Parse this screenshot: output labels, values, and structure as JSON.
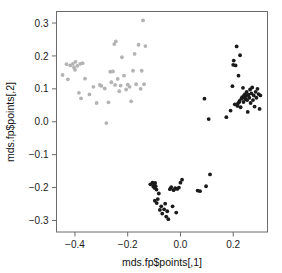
{
  "chart_data": {
    "type": "scatter",
    "title": "",
    "xlabel": "mds.fp$points[,1]",
    "ylabel": "mds.fp$points[,2]",
    "xlim": [
      -0.47,
      0.33
    ],
    "ylim": [
      -0.335,
      0.335
    ],
    "xticks": [
      -0.4,
      -0.2,
      0.0,
      0.2
    ],
    "xtick_labels": [
      "-0.4",
      "-0.2",
      "0.0",
      "0.2"
    ],
    "yticks": [
      -0.3,
      -0.2,
      -0.1,
      0.0,
      0.1,
      0.2,
      0.3
    ],
    "ytick_labels": [
      "-0.3",
      "-0.2",
      "-0.1",
      "0.0",
      "0.1",
      "0.2",
      "0.3"
    ],
    "grid": false,
    "legend": "none",
    "point_radius": 1.9,
    "series": [
      {
        "name": "cluster-light-left",
        "color": "#b3b3b3",
        "marker": "filled-circle",
        "points": [
          [
            -0.447,
            0.142
          ],
          [
            -0.432,
            0.175
          ],
          [
            -0.427,
            0.129
          ],
          [
            -0.418,
            0.171
          ],
          [
            -0.408,
            0.176
          ],
          [
            -0.404,
            0.165
          ],
          [
            -0.4,
            0.158
          ],
          [
            -0.398,
            0.182
          ],
          [
            -0.391,
            0.17
          ],
          [
            -0.385,
            0.088
          ],
          [
            -0.38,
            0.176
          ],
          [
            -0.377,
            0.071
          ],
          [
            -0.371,
            0.178
          ],
          [
            -0.362,
            0.131
          ],
          [
            -0.345,
            0.083
          ],
          [
            -0.33,
            0.106
          ],
          [
            -0.318,
            0.057
          ],
          [
            -0.306,
            0.112
          ],
          [
            -0.3,
            0.109
          ],
          [
            -0.287,
            0.101
          ],
          [
            -0.281,
            -0.004
          ],
          [
            -0.273,
            0.059
          ],
          [
            -0.266,
            0.152
          ],
          [
            -0.262,
            0.12
          ],
          [
            -0.256,
            0.153
          ],
          [
            -0.251,
            0.236
          ],
          [
            -0.248,
            0.112
          ],
          [
            -0.245,
            0.244
          ],
          [
            -0.238,
            0.13
          ],
          [
            -0.232,
            0.093
          ],
          [
            -0.227,
            0.11
          ],
          [
            -0.222,
            0.196
          ],
          [
            -0.214,
            0.14
          ],
          [
            -0.206,
            0.098
          ],
          [
            -0.2,
            0.113
          ],
          [
            -0.193,
            0.106
          ],
          [
            -0.187,
            0.062
          ],
          [
            -0.18,
            0.155
          ],
          [
            -0.174,
            0.206
          ],
          [
            -0.168,
            0.114
          ],
          [
            -0.159,
            0.234
          ],
          [
            -0.151,
            0.1
          ],
          [
            -0.147,
            0.155
          ],
          [
            -0.142,
            0.308
          ],
          [
            -0.138,
            0.114
          ],
          [
            -0.133,
            0.23
          ]
        ]
      },
      {
        "name": "cluster-dark-right",
        "color": "#1a1a1a",
        "marker": "filled-circle",
        "points": [
          [
            0.091,
            0.07
          ],
          [
            0.107,
            0.008
          ],
          [
            0.174,
            0.014
          ],
          [
            0.19,
            0.034
          ],
          [
            0.197,
            0.108
          ],
          [
            0.2,
            0.173
          ],
          [
            0.202,
            0.186
          ],
          [
            0.206,
            0.053
          ],
          [
            0.209,
            0.171
          ],
          [
            0.213,
            0.229
          ],
          [
            0.216,
            0.048
          ],
          [
            0.218,
            0.056
          ],
          [
            0.22,
            0.14
          ],
          [
            0.222,
            0.059
          ],
          [
            0.224,
            0.063
          ],
          [
            0.226,
            0.202
          ],
          [
            0.228,
            0.044
          ],
          [
            0.231,
            0.07
          ],
          [
            0.234,
            0.075
          ],
          [
            0.237,
            0.103
          ],
          [
            0.239,
            0.06
          ],
          [
            0.241,
            0.08
          ],
          [
            0.243,
            0.073
          ],
          [
            0.245,
            0.084
          ],
          [
            0.247,
            0.068
          ],
          [
            0.249,
            0.078
          ],
          [
            0.251,
            0.091
          ],
          [
            0.253,
            0.066
          ],
          [
            0.255,
            0.03
          ],
          [
            0.258,
            0.082
          ],
          [
            0.261,
            0.073
          ],
          [
            0.264,
            0.098
          ],
          [
            0.266,
            0.057
          ],
          [
            0.269,
            0.086
          ],
          [
            0.272,
            0.104
          ],
          [
            0.275,
            0.066
          ],
          [
            0.278,
            0.08
          ],
          [
            0.281,
            0.046
          ],
          [
            0.285,
            0.091
          ],
          [
            0.288,
            0.073
          ],
          [
            0.292,
            0.1
          ],
          [
            0.296,
            0.084
          ],
          [
            0.3,
            0.039
          ],
          [
            0.303,
            0.08
          ]
        ]
      },
      {
        "name": "cluster-dark-bottom",
        "color": "#1a1a1a",
        "marker": "filled-circle",
        "points": [
          [
            -0.114,
            -0.19
          ],
          [
            -0.106,
            -0.185
          ],
          [
            -0.103,
            -0.197
          ],
          [
            -0.1,
            -0.191
          ],
          [
            -0.098,
            -0.201
          ],
          [
            -0.096,
            -0.186
          ],
          [
            -0.094,
            -0.196
          ],
          [
            -0.091,
            -0.206
          ],
          [
            -0.097,
            -0.24
          ],
          [
            -0.09,
            -0.247
          ],
          [
            -0.086,
            -0.235
          ],
          [
            -0.082,
            -0.218
          ],
          [
            -0.078,
            -0.268
          ],
          [
            -0.073,
            -0.257
          ],
          [
            -0.069,
            -0.279
          ],
          [
            -0.062,
            -0.266
          ],
          [
            -0.058,
            -0.249
          ],
          [
            -0.054,
            -0.288
          ],
          [
            -0.05,
            -0.272
          ],
          [
            -0.046,
            -0.296
          ],
          [
            -0.04,
            -0.205
          ],
          [
            -0.035,
            -0.199
          ],
          [
            -0.03,
            -0.257
          ],
          [
            -0.026,
            -0.208
          ],
          [
            -0.02,
            -0.202
          ],
          [
            -0.016,
            -0.276
          ],
          [
            -0.012,
            -0.204
          ],
          [
            -0.006,
            -0.2
          ],
          [
            0.0,
            -0.185
          ],
          [
            0.006,
            -0.176
          ],
          [
            0.065,
            -0.209
          ],
          [
            0.074,
            -0.211
          ],
          [
            0.097,
            -0.196
          ],
          [
            0.112,
            -0.16
          ]
        ]
      }
    ]
  }
}
